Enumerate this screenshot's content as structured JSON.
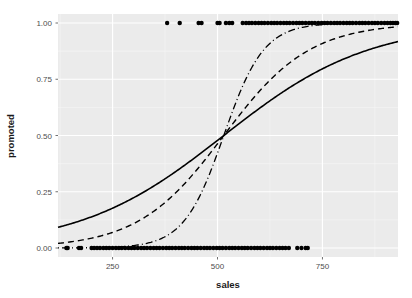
{
  "figure": {
    "background": "#ffffff",
    "panel_background": "#ebebeb",
    "grid_major_color": "#ffffff",
    "grid_minor_color": "#f5f5f5",
    "width": 412,
    "height": 298
  },
  "axes": {
    "x_title": "sales",
    "y_title": "promoted",
    "x_ticks": [
      "250",
      "500",
      "750"
    ],
    "y_ticks": [
      "0.00",
      "0.25",
      "0.50",
      "0.75",
      "1.00"
    ]
  },
  "chart_data": {
    "type": "line",
    "title": "",
    "subtitle": "",
    "xlabel": "sales",
    "ylabel": "promoted",
    "xlim": [
      120,
      930
    ],
    "ylim": [
      -0.04,
      1.04
    ],
    "x_ticks": [
      250,
      500,
      750
    ],
    "y_ticks": [
      0.0,
      0.25,
      0.5,
      0.75,
      1.0
    ],
    "x_tick_labels": [
      "250",
      "500",
      "750"
    ],
    "y_tick_labels": [
      "0.00",
      "0.25",
      "0.50",
      "0.75",
      "1.00"
    ],
    "grid": true,
    "grid_major_y": [
      0.0,
      0.25,
      0.5,
      0.75,
      1.0
    ],
    "grid_major_x": [
      250,
      500,
      750
    ],
    "grid_minor_y": [
      0.125,
      0.375,
      0.625,
      0.875
    ],
    "grid_minor_x": [
      125,
      375,
      625,
      875
    ],
    "legend": "none",
    "legend_position": "none",
    "series": [
      {
        "name": "logistic-shallow",
        "style": "solid",
        "color": "#000000",
        "linewidth": 1.6,
        "model": "logistic",
        "midpoint": 515,
        "slope": 0.0058,
        "points_x": [
          120,
          160,
          200,
          240,
          280,
          320,
          360,
          400,
          440,
          480,
          515,
          550,
          590,
          630,
          670,
          710,
          750,
          790,
          830,
          870,
          900,
          930
        ],
        "points_y": [
          0.071,
          0.088,
          0.109,
          0.135,
          0.166,
          0.203,
          0.246,
          0.296,
          0.352,
          0.413,
          0.5,
          0.545,
          0.608,
          0.667,
          0.722,
          0.771,
          0.814,
          0.85,
          0.88,
          0.905,
          0.92,
          0.933
        ]
      },
      {
        "name": "logistic-medium",
        "style": "dashed",
        "color": "#000000",
        "linewidth": 1.4,
        "dash_pattern": "6,4",
        "model": "logistic",
        "midpoint": 515,
        "slope": 0.0098,
        "points_x": [
          120,
          160,
          200,
          240,
          280,
          320,
          360,
          400,
          440,
          480,
          515,
          550,
          590,
          630,
          670,
          710,
          750,
          790,
          830,
          870,
          900,
          930
        ],
        "points_y": [
          0.021,
          0.031,
          0.045,
          0.066,
          0.095,
          0.134,
          0.186,
          0.252,
          0.332,
          0.419,
          0.5,
          0.581,
          0.666,
          0.742,
          0.805,
          0.856,
          0.896,
          0.926,
          0.948,
          0.964,
          0.973,
          0.98
        ]
      },
      {
        "name": "logistic-steep",
        "style": "dotdash",
        "color": "#000000",
        "linewidth": 1.3,
        "dash_pattern": "1,3,7,3",
        "model": "logistic",
        "midpoint": 515,
        "slope": 0.021,
        "points_x": [
          120,
          160,
          200,
          240,
          280,
          320,
          360,
          400,
          440,
          480,
          515,
          550,
          590,
          630,
          670,
          710,
          750,
          790,
          830,
          870,
          900,
          930
        ],
        "points_y": [
          0.0003,
          0.0007,
          0.0017,
          0.004,
          0.0093,
          0.0216,
          0.0494,
          0.109,
          0.225,
          0.405,
          0.5,
          0.676,
          0.836,
          0.922,
          0.965,
          0.985,
          0.994,
          0.997,
          0.999,
          0.9995,
          0.9998,
          0.9999
        ]
      }
    ],
    "rug_points": {
      "name": "observed-binary-outcomes",
      "marker": "circle",
      "color": "#000000",
      "size": 2.2,
      "y_zero_x": [
        140,
        143,
        170,
        175,
        200,
        206,
        213,
        220,
        228,
        235,
        242,
        250,
        258,
        265,
        272,
        280,
        288,
        295,
        302,
        310,
        318,
        325,
        332,
        340,
        348,
        355,
        362,
        370,
        378,
        385,
        392,
        400,
        408,
        415,
        422,
        430,
        438,
        445,
        452,
        460,
        468,
        475,
        482,
        490,
        498,
        505,
        512,
        520,
        528,
        535,
        542,
        550,
        558,
        565,
        572,
        580,
        588,
        595,
        602,
        610,
        618,
        625,
        632,
        640,
        648,
        655,
        662,
        670,
        690,
        700,
        710,
        715
      ],
      "y_one_x": [
        380,
        410,
        455,
        462,
        500,
        505,
        520,
        528,
        535,
        560,
        568,
        575,
        582,
        590,
        598,
        605,
        612,
        620,
        628,
        635,
        642,
        650,
        658,
        665,
        672,
        680,
        688,
        695,
        702,
        710,
        718,
        725,
        732,
        740,
        748,
        755,
        762,
        770,
        778,
        785,
        792,
        800,
        808,
        815,
        822,
        830,
        838,
        845,
        852,
        860,
        868,
        875,
        882,
        890,
        898,
        905,
        912,
        918,
        924,
        928
      ]
    }
  }
}
